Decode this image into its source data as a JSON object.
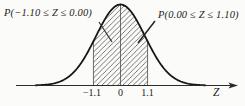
{
  "figure": {
    "left_label": "P(−1.10 ≤ Z ≤ 0.00)",
    "right_label": "P(0.00 ≤ Z ≤ 1.10)",
    "axis_label": "Z",
    "ticks": [
      "−1.1",
      "0",
      "1.1"
    ]
  },
  "chart_data": {
    "type": "area",
    "title": "",
    "curve": "standard normal density (mean 0, sd 1)",
    "xlabel": "Z",
    "x_tick_values": [
      -1.1,
      0,
      1.1
    ],
    "x_tick_labels": [
      "−1.1",
      "0",
      "1.1"
    ],
    "visible_z_range": [
      -3.45,
      3.45
    ],
    "boundary_lines_z": [
      -1.1,
      0,
      1.1
    ],
    "shaded_regions": [
      {
        "from": -1.1,
        "to": 0,
        "fill": "diagonal-hatch",
        "label": "P(−1.10 ≤ Z ≤ 0.00)"
      },
      {
        "from": 0,
        "to": 1.1,
        "fill": "diagonal-hatch",
        "label": "P(0.00 ≤ Z ≤ 1.10)"
      }
    ],
    "annotations": [
      {
        "text": "P(−1.10 ≤ Z ≤ 0.00)",
        "points_to": "left shaded half",
        "position": "top-left"
      },
      {
        "text": "P(0.00 ≤ Z ≤ 1.10)",
        "points_to": "right shaded half",
        "position": "top-right"
      }
    ],
    "legend": "none",
    "grid": false
  },
  "colors": {
    "ink": "#1b1b1b",
    "curve": "#161616",
    "hatch": "#565656",
    "boundary": "#4a4a4a",
    "axis": "#2b2b2b",
    "background": "#fbfbf9"
  }
}
